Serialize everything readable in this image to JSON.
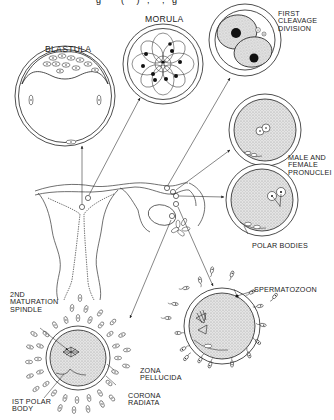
{
  "figure": {
    "title_fragment": "g        (     )   ,     ,   g"
  },
  "labels": {
    "blastula": "BLASTULA",
    "morula": "MORULA",
    "first_cleavage": "FIRST\nCLEAVAGE\nDIVISION",
    "pronuclei": "MALE AND\nFEMALE\nPRONUCLEI",
    "polar_bodies": "POLAR BODIES",
    "spermatozoon": "SPERMATOZOON",
    "maturation_spindle": "2ND\nMATURATION\nSPINDLE",
    "zona_pellucida": "ZONA\nPELLUCIDA",
    "corona_radiata": "CORONA\nRADIATA",
    "first_polar_body": "IST POLAR\nBODY"
  },
  "stages": [
    {
      "name": "Ovulated oocyte",
      "label_keys": [
        "maturation_spindle",
        "zona_pellucida",
        "corona_radiata",
        "first_polar_body"
      ]
    },
    {
      "name": "Fertilization",
      "label_keys": [
        "spermatozoon"
      ]
    },
    {
      "name": "Pronuclear stage",
      "label_keys": [
        "pronuclei",
        "polar_bodies"
      ]
    },
    {
      "name": "Pronuclei fusing",
      "label_keys": []
    },
    {
      "name": "First cleavage",
      "label_keys": [
        "first_cleavage"
      ]
    },
    {
      "name": "Morula",
      "label_keys": [
        "morula"
      ]
    },
    {
      "name": "Blastula",
      "label_keys": [
        "blastula"
      ]
    }
  ],
  "colors": {
    "line": "#222222",
    "cytoplasm": "#d9d9d9",
    "nucleus": "#111111",
    "background": "#ffffff"
  }
}
